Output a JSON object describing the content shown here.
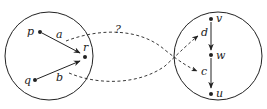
{
  "diagram": {
    "left_set": {
      "nodes": [
        {
          "id": "p",
          "label": "p"
        },
        {
          "id": "q",
          "label": "q"
        },
        {
          "id": "r",
          "label": "r"
        }
      ],
      "edges": [
        {
          "from": "p",
          "to": "r",
          "label": "a"
        },
        {
          "from": "q",
          "to": "r",
          "label": "b"
        }
      ]
    },
    "right_set": {
      "nodes": [
        {
          "id": "v",
          "label": "v"
        },
        {
          "id": "w",
          "label": "w"
        },
        {
          "id": "u",
          "label": "u"
        }
      ],
      "edges": [
        {
          "from": "v",
          "to": "w",
          "label": ""
        },
        {
          "from": "w",
          "to": "u",
          "label": ""
        }
      ]
    },
    "mappings": [
      {
        "from_edge": "a",
        "to_label": "d",
        "style": "dashed"
      },
      {
        "from_edge": "b",
        "to_label": "c",
        "style": "dashed"
      }
    ],
    "question_label": "?",
    "colors": {
      "stroke": "#222222",
      "background": "#ffffff"
    }
  }
}
